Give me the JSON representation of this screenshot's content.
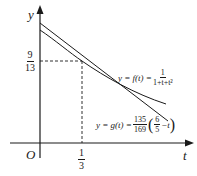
{
  "axes": {
    "x_label": "t",
    "y_label": "y",
    "origin_label": "O"
  },
  "ticks": {
    "x_tick": {
      "num": "1",
      "den": "3"
    },
    "y_tick": {
      "num": "9",
      "den": "13"
    }
  },
  "curves": {
    "f": {
      "label_prefix": "y = f(t) =",
      "frac_num": "1",
      "frac_den": "1+t+t²"
    },
    "g": {
      "label_prefix": "y = g(t) =",
      "coef_num": "135",
      "coef_den": "169",
      "inner_num": "6",
      "inner_den": "5",
      "inner_suffix": "−t"
    }
  },
  "colors": {
    "stroke": "#1a1a1a",
    "background": "#ffffff"
  }
}
